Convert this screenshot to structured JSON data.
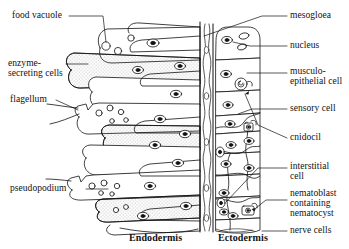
{
  "figure": {
    "type": "labelled-biological-diagram",
    "background_color": "#ffffff",
    "line_color": "#111111"
  },
  "labels_left": [
    {
      "id": "food-vacuole",
      "text": "food vacuole",
      "x": 12,
      "y": 10
    },
    {
      "id": "enzyme-secreting-cells",
      "text": "enzyme-",
      "x": 8,
      "y": 60
    },
    {
      "id": "enzyme-secreting-cells-2",
      "text": "secreting cells",
      "x": 8,
      "y": 70
    },
    {
      "id": "flagellum",
      "text": "flagellum",
      "x": 10,
      "y": 96
    },
    {
      "id": "pseudopodium",
      "text": "pseudopodium",
      "x": 10,
      "y": 184
    }
  ],
  "labels_right": [
    {
      "id": "mesogloea",
      "text": "mesogloea",
      "x": 288,
      "y": 10
    },
    {
      "id": "nucleus",
      "text": "nucleus",
      "x": 288,
      "y": 41
    },
    {
      "id": "musculo-epithelial-1",
      "text": "musculo-",
      "x": 288,
      "y": 68
    },
    {
      "id": "musculo-epithelial-2",
      "text": "epithelial cell",
      "x": 288,
      "y": 78
    },
    {
      "id": "sensory-cell",
      "text": "sensory cell",
      "x": 288,
      "y": 104
    },
    {
      "id": "cnidocil",
      "text": "cnidocil",
      "x": 288,
      "y": 135
    },
    {
      "id": "interstitial-cell-1",
      "text": "interstitial",
      "x": 288,
      "y": 163
    },
    {
      "id": "interstitial-cell-2",
      "text": "cell",
      "x": 288,
      "y": 173
    },
    {
      "id": "nematoblast-1",
      "text": "nematoblast",
      "x": 288,
      "y": 190
    },
    {
      "id": "nematoblast-2",
      "text": "containing",
      "x": 288,
      "y": 200
    },
    {
      "id": "nematoblast-3",
      "text": "nematocyst",
      "x": 288,
      "y": 210
    },
    {
      "id": "nerve-cells",
      "text": "nerve cells",
      "x": 288,
      "y": 227
    }
  ],
  "labels_bottom": [
    {
      "id": "endodermis",
      "text": "Endodermis",
      "x": 132,
      "y": 234
    },
    {
      "id": "ectodermis",
      "text": "Ectodermis",
      "x": 220,
      "y": 234
    }
  ],
  "structures": {
    "endodermis": {
      "name": "Endodermis",
      "description": "Layer of elongated horizontal cells on the left, some stippled (enzyme-secreting), bearing nuclei, food vacuoles, flagella and pseudopodia.",
      "cell_count": 11
    },
    "mesogloea": {
      "name": "mesogloea",
      "description": "Narrow wavy acellular band separating the two cell layers."
    },
    "ectodermis": {
      "name": "Ectodermis",
      "description": "Layer of stacked cells on the right including musculo-epithelial cells, sensory cells, interstitial cells, nematoblasts with nematocysts and nerve cells."
    }
  }
}
